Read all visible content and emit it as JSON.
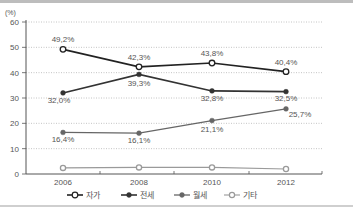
{
  "chart_data": {
    "type": "line",
    "title": "",
    "ylabel": "(%)",
    "xlabel": "",
    "ylim": [
      0,
      60
    ],
    "yticks": [
      0,
      10,
      20,
      30,
      40,
      50,
      60
    ],
    "grid": "horizontal dotted",
    "legend_position": "bottom",
    "categories": [
      "2006",
      "2008",
      "2010",
      "2012"
    ],
    "series": [
      {
        "name": "자가",
        "marker": "open-circle-dark",
        "values": [
          49.2,
          42.3,
          43.8,
          40.4
        ],
        "labels": [
          "49,2%",
          "42,3%",
          "43,8%",
          "40,4%"
        ]
      },
      {
        "name": "전세",
        "marker": "filled-circle-dark",
        "values": [
          32.0,
          39.3,
          32.8,
          32.5
        ],
        "labels": [
          "32,0%",
          "39,3%",
          "32,8%",
          "32,5%"
        ]
      },
      {
        "name": "월세",
        "marker": "filled-circle-gray",
        "values": [
          16.4,
          16.1,
          21.1,
          25.7
        ],
        "labels": [
          "16,4%",
          "16,1%",
          "21,1%",
          "25,7%"
        ]
      },
      {
        "name": "기타",
        "marker": "open-circle-light",
        "values": [
          2.4,
          2.6,
          2.6,
          2.0
        ],
        "labels": []
      }
    ]
  },
  "colors": {
    "jaga": "#222222",
    "jeonse": "#333333",
    "wolse": "#666666",
    "gita": "#9a9a9a",
    "grid": "#b5b5b5",
    "axis": "#555555",
    "text": "#555555"
  }
}
